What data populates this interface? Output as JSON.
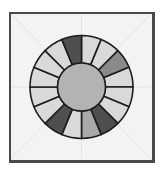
{
  "diagram": {
    "type": "segmented-ring",
    "segment_count": 16,
    "segments": [
      {
        "start_deg": 0,
        "end_deg": 22.5,
        "shade": "light"
      },
      {
        "start_deg": 22.5,
        "end_deg": 45,
        "shade": "light"
      },
      {
        "start_deg": 45,
        "end_deg": 67.5,
        "shade": "medium-dark"
      },
      {
        "start_deg": 67.5,
        "end_deg": 90,
        "shade": "light"
      },
      {
        "start_deg": 90,
        "end_deg": 112.5,
        "shade": "light"
      },
      {
        "start_deg": 112.5,
        "end_deg": 135,
        "shade": "light"
      },
      {
        "start_deg": 135,
        "end_deg": 157.5,
        "shade": "dark"
      },
      {
        "start_deg": 157.5,
        "end_deg": 180,
        "shade": "medium"
      },
      {
        "start_deg": 180,
        "end_deg": 202.5,
        "shade": "light"
      },
      {
        "start_deg": 202.5,
        "end_deg": 225,
        "shade": "dark"
      },
      {
        "start_deg": 225,
        "end_deg": 247.5,
        "shade": "light"
      },
      {
        "start_deg": 247.5,
        "end_deg": 270,
        "shade": "light"
      },
      {
        "start_deg": 270,
        "end_deg": 292.5,
        "shade": "light"
      },
      {
        "start_deg": 292.5,
        "end_deg": 315,
        "shade": "light"
      },
      {
        "start_deg": 315,
        "end_deg": 337.5,
        "shade": "light"
      },
      {
        "start_deg": 337.5,
        "end_deg": 360,
        "shade": "dark"
      }
    ],
    "colors": {
      "light": "#d9d9d9",
      "medium": "#a9a9a9",
      "medium-dark": "#8a8a8a",
      "dark": "#4f4f4f",
      "hub": "#b3b3b3",
      "stroke": "#1e1e1e",
      "background": "#f3f3f3",
      "guide": "#e2e2e2"
    }
  }
}
